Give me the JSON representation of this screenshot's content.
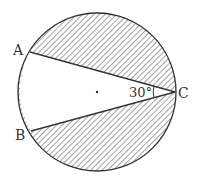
{
  "diagram": {
    "type": "circle-inscribed-angle",
    "colors": {
      "stroke": "#333333",
      "hatch": "#444444",
      "background": "#ffffff"
    },
    "circle": {
      "cx": 97,
      "cy": 92,
      "r": 79
    },
    "points": {
      "A": {
        "label": "A",
        "x": 30,
        "y": 52
      },
      "B": {
        "label": "B",
        "x": 31,
        "y": 131
      },
      "C": {
        "label": "C",
        "x": 175,
        "y": 92
      },
      "O": {
        "label": "",
        "x": 97,
        "y": 92
      }
    },
    "angle": {
      "vertex": "C",
      "label": "30°",
      "value_deg": 30
    },
    "shaded_region": "circle minus triangle region ACB (segments above AC and below BC)"
  }
}
